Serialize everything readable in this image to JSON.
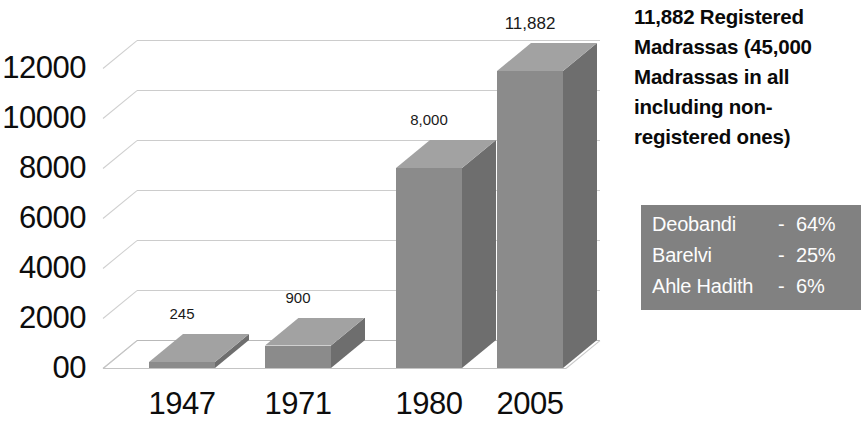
{
  "chart_data": {
    "type": "bar",
    "title": "",
    "subtitle": "",
    "xlabel": "",
    "ylabel": "",
    "categories": [
      "1947",
      "1971",
      "1980",
      "2005"
    ],
    "values": [
      245,
      900,
      8000,
      11882
    ],
    "value_labels": [
      "245",
      "900",
      "8,000",
      "11,882"
    ],
    "ylim": [
      0,
      13000
    ],
    "yticks": [
      0,
      2000,
      4000,
      6000,
      8000,
      10000,
      12000
    ],
    "ytick_labels": [
      "00",
      "2000",
      "4000",
      "6000",
      "8000",
      "10000",
      "12000"
    ],
    "grid": true,
    "legend_position": "right",
    "style": "3d-columns",
    "series": [
      {
        "name": "Registered Madrassas",
        "values": [
          245,
          900,
          8000,
          11882
        ]
      }
    ],
    "annotations": [
      "11,882 Registered Madrassas (45,000 Madrassas in all including non-registered ones)"
    ],
    "breakdown": {
      "title": "",
      "rows": [
        {
          "label": "Deobandi",
          "dash": "-",
          "value": "64%",
          "percent": 64
        },
        {
          "label": "Barelvi",
          "dash": "-",
          "value": "25%",
          "percent": 25
        },
        {
          "label": "Ahle Hadith",
          "dash": "-",
          "value": "6%",
          "percent": 6
        }
      ]
    }
  },
  "axis": {
    "y_ticks": [
      {
        "label": "12000",
        "value": 12000
      },
      {
        "label": "10000",
        "value": 10000
      },
      {
        "label": "8000",
        "value": 8000
      },
      {
        "label": "6000",
        "value": 6000
      },
      {
        "label": "4000",
        "value": 4000
      },
      {
        "label": "2000",
        "value": 2000
      },
      {
        "label": "00",
        "value": 0
      }
    ],
    "x_ticks": [
      {
        "label": "1947"
      },
      {
        "label": "1971"
      },
      {
        "label": "1980"
      },
      {
        "label": "2005"
      }
    ]
  },
  "bars": [
    {
      "category": "1947",
      "value": 245,
      "label": "245"
    },
    {
      "category": "1971",
      "value": 900,
      "label": "900"
    },
    {
      "category": "1980",
      "value": 8000,
      "label": "8,000"
    },
    {
      "category": "2005",
      "value": 11882,
      "label": "11,882"
    }
  ],
  "annotation": {
    "text": "11,882 Registered Madrassas (45,000 Madrassas in all including non-registered ones)"
  },
  "legend": {
    "rows": [
      {
        "name": "Deobandi",
        "dash": "-",
        "value": "64%"
      },
      {
        "name": "Barelvi",
        "dash": "-",
        "value": "25%"
      },
      {
        "name": "Ahle Hadith",
        "dash": "-",
        "value": "6%"
      }
    ]
  },
  "colors": {
    "bar_front": "#8b8b8b",
    "bar_side": "#6e6e6e",
    "bar_top": "#a2a2a2",
    "legend_panel": "#818181",
    "legend_text": "#ffffff",
    "grid": "#c9c9c9",
    "text": "#0d0d0d",
    "background": "#ffffff"
  }
}
